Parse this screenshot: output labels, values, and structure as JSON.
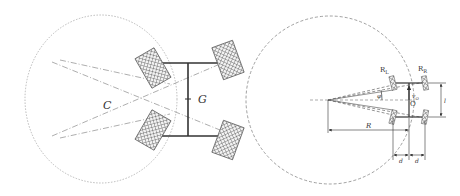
{
  "left_figure": {
    "center_label": "C",
    "centroid_label": "G",
    "description": "four-wheel vehicle turning about center C"
  },
  "right_figure": {
    "labels": {
      "left_wheel_radius": "R",
      "left_wheel_sub": "L",
      "right_wheel_radius": "R",
      "right_wheel_sub": "R",
      "angle": "φ",
      "velocity": "v",
      "velocity_sub": "O",
      "origin": "O",
      "turn_radius": "R",
      "track_length": "l",
      "half_width_left": "d",
      "half_width_right": "d"
    }
  },
  "colors": {
    "line": "#333333",
    "dashed": "#888888",
    "hatch": "#666666"
  }
}
